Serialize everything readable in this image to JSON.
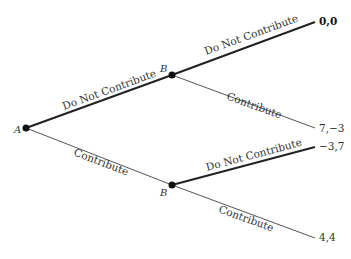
{
  "diagram": {
    "type": "game-tree",
    "nodes": {
      "root": {
        "label": "A"
      },
      "upper": {
        "label": "B"
      },
      "lower": {
        "label": "B"
      }
    },
    "edges": {
      "a_dnc": {
        "label": "Do Not Contribute"
      },
      "a_c": {
        "label": "Contribute"
      },
      "bu_dnc": {
        "label": "Do Not Contribute"
      },
      "bu_c": {
        "label": "Contribute"
      },
      "bl_dnc": {
        "label": "Do Not Contribute"
      },
      "bl_c": {
        "label": "Contribute"
      }
    },
    "payoffs": {
      "p1": "0,0",
      "p2": "7,−3",
      "p3": "−3,7",
      "p4": "4,4"
    },
    "colors": {
      "line": "#222222",
      "line_light": "#555555",
      "node": "#111111",
      "text": "#333333"
    }
  }
}
